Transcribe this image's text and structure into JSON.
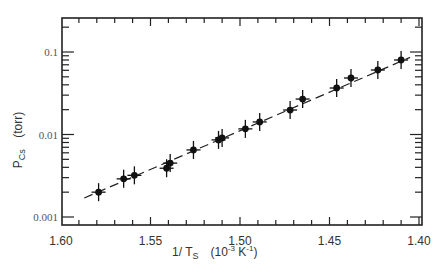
{
  "chart_data": {
    "type": "scatter",
    "title": "",
    "xlabel": "1/T_S (10^-3 K^-1)",
    "ylabel": "P_Cs (torr)",
    "xlabel_parts": {
      "main": "1/ T",
      "sub": "S",
      "units": "(10",
      "exp": "-3",
      "units2": " K",
      "exp2": "-1",
      "close": ")"
    },
    "ylabel_parts": {
      "main": "P",
      "sub": "Cs",
      "units": "(torr)"
    },
    "x_axis": {
      "reversed": true,
      "range": [
        1.6,
        1.4
      ],
      "ticks": [
        1.6,
        1.55,
        1.5,
        1.45,
        1.4
      ],
      "tick_labels": [
        "1.60",
        "1.55",
        "1.50",
        "1.45",
        "1.40"
      ]
    },
    "y_axis": {
      "scale": "log",
      "range": [
        0.001,
        0.25
      ],
      "ticks": [
        0.001,
        0.01,
        0.1
      ],
      "tick_labels": [
        "0.001",
        "0.01",
        "0.1"
      ]
    },
    "grid": false,
    "legend": null,
    "series": [
      {
        "name": "measured",
        "marker": "filled-circle-with-error-bars",
        "x": [
          1.579,
          1.565,
          1.559,
          1.541,
          1.539,
          1.526,
          1.512,
          1.51,
          1.497,
          1.489,
          1.472,
          1.465,
          1.446,
          1.438,
          1.423,
          1.41
        ],
        "y": [
          0.002,
          0.0029,
          0.0032,
          0.0039,
          0.0045,
          0.0065,
          0.0086,
          0.0091,
          0.0117,
          0.0142,
          0.0198,
          0.0269,
          0.0366,
          0.0484,
          0.0605,
          0.08
        ]
      },
      {
        "name": "fit",
        "line": "dashed",
        "x": [
          1.587,
          1.405
        ],
        "y": [
          0.0017,
          0.086
        ]
      }
    ]
  }
}
